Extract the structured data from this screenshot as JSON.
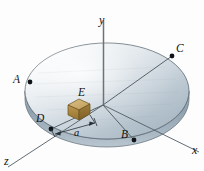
{
  "figure": {
    "background_color": "#fdfdfd"
  },
  "axes": [
    {
      "name": "y-axis",
      "label": "y",
      "label_x": 101,
      "label_y": 16,
      "color": "#6e7175"
    },
    {
      "name": "x-axis",
      "label": "x",
      "label_x": 192,
      "label_y": 145,
      "color": "#55585c"
    },
    {
      "name": "z-axis",
      "label": "z",
      "label_x": 5,
      "label_y": 156,
      "color": "#55585c"
    }
  ],
  "points": [
    {
      "name": "A",
      "label": "A",
      "label_x": 14,
      "label_y": 74,
      "dot_x": 30,
      "dot_y": 82
    },
    {
      "name": "B",
      "label": "B",
      "label_x": 122,
      "label_y": 130,
      "dot_x": 134,
      "dot_y": 140
    },
    {
      "name": "C",
      "label": "C",
      "label_x": 176,
      "label_y": 44,
      "dot_x": 172,
      "dot_y": 56
    },
    {
      "name": "D",
      "label": "D",
      "label_x": 37,
      "label_y": 114,
      "dot_x": 51,
      "dot_y": 129
    },
    {
      "name": "E",
      "label": "E",
      "label_x": 79,
      "label_y": 90,
      "dot_x": 79,
      "dot_y": 109
    }
  ],
  "dimension": {
    "name": "a",
    "label": "a",
    "label_x": 76,
    "label_y": 134
  },
  "cables": [
    {
      "name": "cable-A",
      "x": 30,
      "y_top": 12,
      "y_bottom": 82,
      "color": "#3f9ad4"
    },
    {
      "name": "cable-B",
      "x": 134,
      "y_top": 90,
      "y_bottom": 140,
      "color": "#3f9ad4"
    },
    {
      "name": "cable-C",
      "x": 172,
      "y_top": 10,
      "y_bottom": 56,
      "color": "#3f9ad4"
    }
  ],
  "disk": {
    "name": "circular-disk",
    "center_x": 107,
    "center_y": 91,
    "radius_x": 82,
    "radius_y": 48,
    "thickness": 8,
    "top_fill_light": "#f2f5f7",
    "top_fill_mid": "#c8d2da",
    "top_fill_dark": "#9fb0bc",
    "rim_fill": "#8ea0ad",
    "outline_color": "#5e6b75"
  },
  "block": {
    "name": "block-E",
    "top_color": "#c9a96a",
    "left_color": "#a8833f",
    "right_color": "#8d6c34",
    "outline_color": "#6b5223",
    "cx": 79,
    "cy": 109,
    "size": 11
  },
  "origin": {
    "x": 103,
    "y": 105
  }
}
